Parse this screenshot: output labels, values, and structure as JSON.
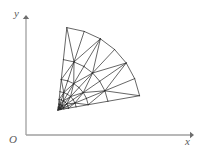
{
  "figure": {
    "kind": "triangular-finite-element-mesh-on-circular-sector",
    "background_color": "#ffffff",
    "axes": {
      "color": "#a0a0a0",
      "line_width": 1.2,
      "origin_px": [
        26,
        135
      ],
      "x_axis": {
        "from_px": [
          26,
          135
        ],
        "to_px": [
          192,
          135
        ],
        "arrow": "right"
      },
      "y_axis": {
        "from_px": [
          26,
          135
        ],
        "to_px": [
          26,
          17
        ],
        "arrow": "up"
      },
      "labels": {
        "x": "x",
        "y": "y",
        "origin": "O"
      }
    },
    "mesh": {
      "color": "#2b2b2b",
      "line_width": 0.7,
      "apex_px": [
        58,
        110
      ],
      "outer_corner_top_px": [
        67,
        26
      ],
      "outer_corner_right_px": [
        138,
        96
      ],
      "angle_start_deg": 3,
      "angle_end_deg": 84,
      "radial_rings": 8,
      "angular_divisions": 6,
      "grading": "geometric-refinement-toward-apex",
      "grading_ratio": 0.62,
      "diagonal_direction": "alternating"
    }
  },
  "chart_data": {
    "type": "scatter",
    "title": "",
    "xlabel": "x",
    "ylabel": "y",
    "grid": false,
    "legend": null,
    "annotations": [
      "O"
    ]
  }
}
